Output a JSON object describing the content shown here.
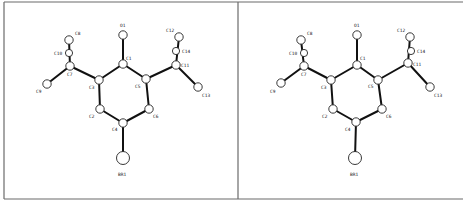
{
  "figure": {
    "type": "stereo-pair ORTEP molecular structure",
    "panels": [
      {
        "id": "left",
        "atoms": [
          {
            "label": "O1",
            "x": 123,
            "y": 35,
            "r": 4.2,
            "lx": 120,
            "ly": 27
          },
          {
            "label": "C1",
            "x": 123,
            "y": 64,
            "r": 4.2,
            "lx": 126,
            "ly": 60
          },
          {
            "label": "C5",
            "x": 146,
            "y": 79,
            "r": 4.2,
            "lx": 135,
            "ly": 88
          },
          {
            "label": "C3",
            "x": 99,
            "y": 80,
            "r": 4.2,
            "lx": 89,
            "ly": 89
          },
          {
            "label": "C2",
            "x": 100,
            "y": 109,
            "r": 4.2,
            "lx": 89,
            "ly": 118
          },
          {
            "label": "C6",
            "x": 149,
            "y": 109,
            "r": 4.2,
            "lx": 153,
            "ly": 118
          },
          {
            "label": "C4",
            "x": 123,
            "y": 123,
            "r": 4.2,
            "lx": 112,
            "ly": 131
          },
          {
            "label": "BR1",
            "x": 123,
            "y": 158,
            "r": 6.5,
            "lx": 118,
            "ly": 176
          },
          {
            "label": "C7",
            "x": 70,
            "y": 66,
            "r": 4.2,
            "lx": 67,
            "ly": 76
          },
          {
            "label": "C8",
            "x": 69,
            "y": 40,
            "r": 4.2,
            "lx": 75,
            "ly": 35
          },
          {
            "label": "C10",
            "x": 69,
            "y": 53,
            "r": 3.6,
            "lx": 54,
            "ly": 55
          },
          {
            "label": "C9",
            "x": 47,
            "y": 84,
            "r": 4.2,
            "lx": 36,
            "ly": 93
          },
          {
            "label": "C11",
            "x": 176,
            "y": 65,
            "r": 4.2,
            "lx": 181,
            "ly": 67
          },
          {
            "label": "C12",
            "x": 179,
            "y": 37,
            "r": 4.2,
            "lx": 166,
            "ly": 32
          },
          {
            "label": "C14",
            "x": 176,
            "y": 51,
            "r": 3.6,
            "lx": 182,
            "ly": 53
          },
          {
            "label": "C13",
            "x": 198,
            "y": 87,
            "r": 4.2,
            "lx": 202,
            "ly": 97
          }
        ]
      },
      {
        "id": "right",
        "atoms": [
          {
            "label": "O1",
            "x": 357,
            "y": 35,
            "r": 4.2,
            "lx": 354,
            "ly": 27
          },
          {
            "label": "C1",
            "x": 357,
            "y": 65,
            "r": 4.2,
            "lx": 360,
            "ly": 60
          },
          {
            "label": "C5",
            "x": 378,
            "y": 80,
            "r": 4.2,
            "lx": 368,
            "ly": 88
          },
          {
            "label": "C3",
            "x": 331,
            "y": 80,
            "r": 4.2,
            "lx": 321,
            "ly": 89
          },
          {
            "label": "C2",
            "x": 333,
            "y": 109,
            "r": 4.2,
            "lx": 322,
            "ly": 118
          },
          {
            "label": "C6",
            "x": 382,
            "y": 109,
            "r": 4.2,
            "lx": 386,
            "ly": 118
          },
          {
            "label": "C4",
            "x": 356,
            "y": 122,
            "r": 4.2,
            "lx": 345,
            "ly": 131
          },
          {
            "label": "BR1",
            "x": 355,
            "y": 158,
            "r": 6.5,
            "lx": 350,
            "ly": 176
          },
          {
            "label": "C7",
            "x": 304,
            "y": 66,
            "r": 4.2,
            "lx": 301,
            "ly": 76
          },
          {
            "label": "C8",
            "x": 301,
            "y": 40,
            "r": 4.2,
            "lx": 307,
            "ly": 35
          },
          {
            "label": "C10",
            "x": 304,
            "y": 53,
            "r": 3.6,
            "lx": 289,
            "ly": 55
          },
          {
            "label": "C9",
            "x": 281,
            "y": 83,
            "r": 4.2,
            "lx": 270,
            "ly": 93
          },
          {
            "label": "C11",
            "x": 408,
            "y": 63,
            "r": 4.2,
            "lx": 413,
            "ly": 66
          },
          {
            "label": "C12",
            "x": 410,
            "y": 37,
            "r": 4.2,
            "lx": 397,
            "ly": 32
          },
          {
            "label": "C14",
            "x": 411,
            "y": 51,
            "r": 3.6,
            "lx": 417,
            "ly": 53
          },
          {
            "label": "C13",
            "x": 430,
            "y": 87,
            "r": 4.2,
            "lx": 434,
            "ly": 97
          }
        ]
      }
    ],
    "bonds": [
      [
        "O1",
        "C1"
      ],
      [
        "C1",
        "C5"
      ],
      [
        "C1",
        "C3"
      ],
      [
        "C3",
        "C2"
      ],
      [
        "C5",
        "C6"
      ],
      [
        "C2",
        "C4"
      ],
      [
        "C6",
        "C4"
      ],
      [
        "C4",
        "BR1"
      ],
      [
        "C3",
        "C7"
      ],
      [
        "C7",
        "C8"
      ],
      [
        "C7",
        "C9"
      ],
      [
        "C5",
        "C11"
      ],
      [
        "C11",
        "C12"
      ],
      [
        "C11",
        "C13"
      ]
    ],
    "frame": {
      "left": 4,
      "top": 2,
      "divider": 238,
      "bottom": 199,
      "right": 463,
      "line_color": "#6b6b6b"
    }
  }
}
